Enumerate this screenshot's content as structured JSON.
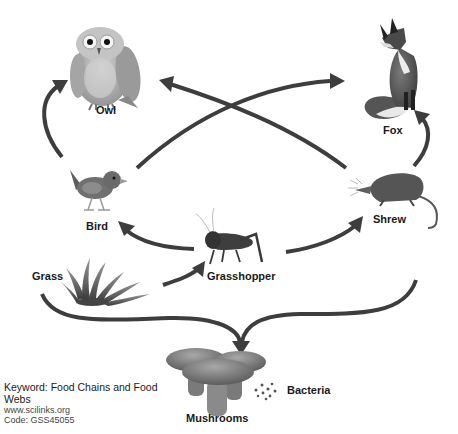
{
  "title": "Food Web",
  "organisms": {
    "owl": {
      "label": "Owl",
      "icon": "owl-icon"
    },
    "fox": {
      "label": "Fox",
      "icon": "fox-icon"
    },
    "bird": {
      "label": "Bird",
      "icon": "bird-icon"
    },
    "shrew": {
      "label": "Shrew",
      "icon": "shrew-icon"
    },
    "grasshopper": {
      "label": "Grasshopper",
      "icon": "grasshopper-icon"
    },
    "grass": {
      "label": "Grass",
      "icon": "grass-icon"
    },
    "mushrooms": {
      "label": "Mushrooms",
      "icon": "mushrooms-icon"
    },
    "bacteria": {
      "label": "Bacteria",
      "icon": "bacteria-icon"
    }
  },
  "energy_flows": [
    {
      "from": "Bird",
      "to": "Owl"
    },
    {
      "from": "Bird",
      "to": "Fox"
    },
    {
      "from": "Shrew",
      "to": "Owl"
    },
    {
      "from": "Shrew",
      "to": "Fox"
    },
    {
      "from": "Grasshopper",
      "to": "Bird"
    },
    {
      "from": "Grasshopper",
      "to": "Shrew"
    },
    {
      "from": "Grass",
      "to": "Grasshopper"
    },
    {
      "from": "Grass",
      "to": "Mushrooms"
    },
    {
      "from": "Shrew",
      "to": "Mushrooms"
    }
  ],
  "footer": {
    "keyword": "Keyword: Food Chains and Food Webs",
    "website": "www.scilinks.org",
    "code": "Code: GSS45055"
  },
  "colors": {
    "arrow": "#3d3d3d",
    "background": "#ffffff",
    "text": "#1a1a1a"
  }
}
